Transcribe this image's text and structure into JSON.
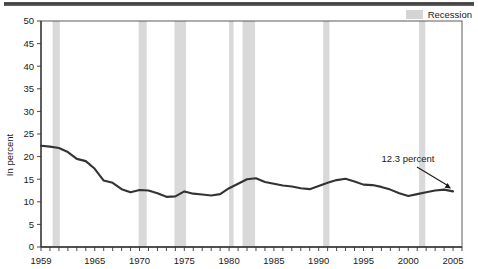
{
  "legend": {
    "items": [
      {
        "label": "Recession",
        "color": "#d4d4d4",
        "icon": "recession-band-swatch"
      }
    ]
  },
  "annotation": {
    "label": "12.3 percent",
    "icon": "arrow-pointer-icon"
  },
  "chart_data": {
    "type": "line",
    "title": "",
    "subtitle": "",
    "xlabel": "",
    "ylabel": "In percent",
    "xlim": [
      1959,
      2006
    ],
    "ylim": [
      0,
      50
    ],
    "grid": false,
    "legend_position": "top-right",
    "y_ticks": [
      0,
      5,
      10,
      15,
      20,
      25,
      30,
      35,
      40,
      45,
      50
    ],
    "y_tick_labels": [
      "0",
      "5",
      "10",
      "15",
      "20",
      "25",
      "30",
      "35",
      "40",
      "45",
      "50"
    ],
    "x_tick_labels": [
      "1959",
      "1965",
      "1970",
      "1975",
      "1980",
      "1985",
      "1990",
      "1995",
      "2000",
      "2005"
    ],
    "x_tick_label_values": [
      1959,
      1965,
      1970,
      1975,
      1980,
      1985,
      1990,
      1995,
      2000,
      2005
    ],
    "x_minor_tick_step": 1,
    "series": [
      {
        "name": "In percent",
        "color": "#333333",
        "x": [
          1959,
          1960,
          1961,
          1962,
          1963,
          1964,
          1965,
          1966,
          1967,
          1968,
          1969,
          1970,
          1971,
          1972,
          1973,
          1974,
          1975,
          1976,
          1977,
          1978,
          1979,
          1980,
          1981,
          1982,
          1983,
          1984,
          1985,
          1986,
          1987,
          1988,
          1989,
          1990,
          1991,
          1992,
          1993,
          1994,
          1995,
          1996,
          1997,
          1998,
          1999,
          2000,
          2001,
          2002,
          2003,
          2004,
          2005
        ],
        "values": [
          22.4,
          22.2,
          21.9,
          21.0,
          19.5,
          19.0,
          17.3,
          14.7,
          14.2,
          12.8,
          12.1,
          12.6,
          12.5,
          11.9,
          11.1,
          11.2,
          12.3,
          11.8,
          11.6,
          11.4,
          11.7,
          13.0,
          14.0,
          15.0,
          15.2,
          14.4,
          14.0,
          13.6,
          13.4,
          13.0,
          12.8,
          13.5,
          14.2,
          14.8,
          15.1,
          14.5,
          13.8,
          13.7,
          13.3,
          12.7,
          11.9,
          11.3,
          11.7,
          12.1,
          12.5,
          12.7,
          12.3
        ]
      }
    ],
    "recession_bands": [
      {
        "start": 1960.3,
        "end": 1961.1
      },
      {
        "start": 1969.9,
        "end": 1970.8
      },
      {
        "start": 1973.9,
        "end": 1975.2
      },
      {
        "start": 1980.0,
        "end": 1980.5
      },
      {
        "start": 1981.5,
        "end": 1982.9
      },
      {
        "start": 1990.5,
        "end": 1991.2
      },
      {
        "start": 2001.2,
        "end": 2001.9
      }
    ],
    "recession_band_color": "#d9d9d9",
    "annotations": [
      {
        "text": "12.3 percent",
        "x": 2005,
        "y": 12.3
      }
    ]
  }
}
